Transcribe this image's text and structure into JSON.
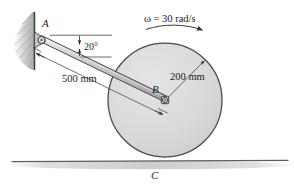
{
  "figure": {
    "type": "engineering-mechanics-diagram",
    "labels": {
      "point_a": "A",
      "point_b": "B",
      "point_c": "C",
      "angle": "20°",
      "rod_length": "500 mm",
      "disk_radius": "200 mm",
      "angular_velocity": "ω = 30 rad/s"
    },
    "colors": {
      "ink": "#1b1b1b",
      "line": "#3a3a3a",
      "disk_fill": "#dcdcdc",
      "disk_edge": "#4a4a4a",
      "rod_fill": "#c9c9c9",
      "rod_edge": "#444444",
      "wall_hatch": "#b9b9b9",
      "ground": "#555555",
      "shadow": "#c8c8c8"
    },
    "geometry": {
      "point_a_px": [
        41,
        40
      ],
      "point_b_px": [
        165,
        100
      ],
      "disk_center_px": [
        165,
        100
      ],
      "disk_radius_px": 57,
      "ground_y_px": 161,
      "rod_angle_deg": 20
    }
  }
}
